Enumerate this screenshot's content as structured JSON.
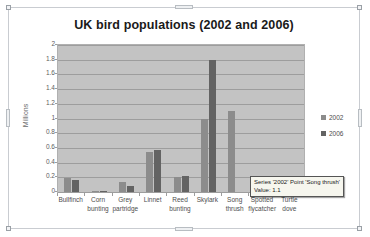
{
  "chart_data": {
    "type": "bar",
    "title": "UK bird populations (2002 and 2006)",
    "xlabel": "",
    "ylabel": "Millions",
    "ylim": [
      0,
      2
    ],
    "yticks": [
      "0",
      "0.2",
      "0.4",
      "0.6",
      "0.8",
      "1",
      "1.2",
      "1.4",
      "1.6",
      "1.8",
      "2"
    ],
    "grid": true,
    "legend_position": "right",
    "categories": [
      "Bullfinch",
      "Corn bunting",
      "Grey partridge",
      "Linnet",
      "Reed bunting",
      "Skylark",
      "Song thrush",
      "Spotted flycatcher",
      "Turtle dove"
    ],
    "category_lines": [
      [
        "Bullfinch"
      ],
      [
        "Corn",
        "bunting"
      ],
      [
        "Grey",
        "partridge"
      ],
      [
        "Linnet"
      ],
      [
        "Reed",
        "bunting"
      ],
      [
        "Skylark"
      ],
      [
        "Song",
        "thrush"
      ],
      [
        "Spotted",
        "flycatcher"
      ],
      [
        "Turtle",
        "dove"
      ]
    ],
    "series": [
      {
        "name": "2002",
        "color": "#8c8c8c",
        "values": [
          0.19,
          0.01,
          0.14,
          0.55,
          0.2,
          1.0,
          1.1,
          0.12,
          0.06
        ]
      },
      {
        "name": "2006",
        "color": "#636363",
        "values": [
          0.16,
          0.01,
          0.08,
          0.57,
          0.22,
          1.8,
          0.0,
          0.0,
          0.0
        ]
      }
    ]
  },
  "legend": {
    "items": [
      {
        "label": "2002",
        "color": "#8c8c8c"
      },
      {
        "label": "2006",
        "color": "#636363"
      }
    ]
  },
  "tooltip": {
    "line1": "Series '2002' Point 'Song thrush'",
    "line2": "Value: 1.1"
  }
}
